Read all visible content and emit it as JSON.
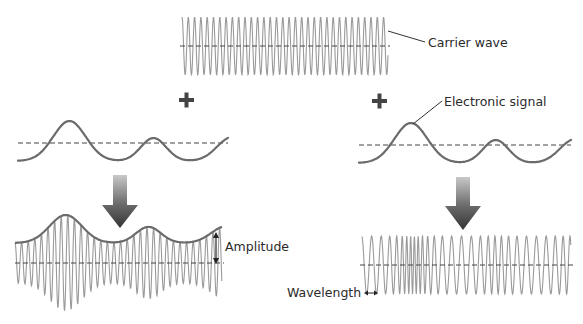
{
  "labels": {
    "carrier": "Carrier wave",
    "signal": "Electronic signal",
    "amplitude": "Amplitude",
    "wavelength": "Wavelength"
  },
  "colors": {
    "carrier": "#9a9a9a",
    "signal": "#6b6b6b",
    "arrow_top": "#c8c8c8",
    "arrow_bottom": "#3a3a3a",
    "text": "#2a2a2a"
  },
  "carrier_wave": {
    "x0": 182,
    "x1": 388,
    "center_y": 46,
    "amplitude": 29,
    "period": 6.3
  },
  "left_panel": {
    "title": "Amplitude modulation",
    "signal": {
      "x0": 18,
      "x1": 228,
      "axis_y": 143
    },
    "am_wave": {
      "x0": 15,
      "x1": 222,
      "center_y": 263,
      "period": 6.6
    }
  },
  "right_panel": {
    "title": "Frequency modulation",
    "signal": {
      "x0": 359,
      "x1": 571,
      "axis_y": 145
    },
    "fm_wave": {
      "x0": 362,
      "x1": 571,
      "center_y": 265,
      "amplitude": 29
    }
  },
  "icons": [
    "plus-icon",
    "plus-icon",
    "down-arrow-icon",
    "down-arrow-icon",
    "double-arrow-icon"
  ]
}
